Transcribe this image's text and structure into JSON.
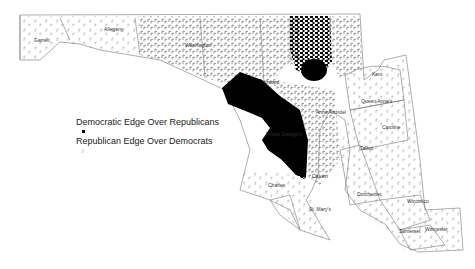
{
  "map": {
    "title": "",
    "legend": {
      "dem_label": "Democratic Edge Over Republicans",
      "rep_label": "Republican Edge Over Democrats",
      "dem_color": "#000000",
      "rep_color": "#888888"
    },
    "counties": [
      {
        "name": "Garrett",
        "x": 34,
        "y": 42
      },
      {
        "name": "Allegany",
        "x": 104,
        "y": 31
      },
      {
        "name": "Washington",
        "x": 185,
        "y": 47
      },
      {
        "name": "Howard",
        "x": 262,
        "y": 84
      },
      {
        "name": "Anne Arundel",
        "x": 316,
        "y": 114
      },
      {
        "name": "Prince George's",
        "x": 266,
        "y": 136
      },
      {
        "name": "Charles",
        "x": 268,
        "y": 187
      },
      {
        "name": "Calvert",
        "x": 312,
        "y": 178
      },
      {
        "name": "St. Mary's",
        "x": 309,
        "y": 211
      },
      {
        "name": "Kent",
        "x": 372,
        "y": 76
      },
      {
        "name": "Queen Anne's",
        "x": 361,
        "y": 103
      },
      {
        "name": "Caroline",
        "x": 382,
        "y": 129
      },
      {
        "name": "Talbot",
        "x": 360,
        "y": 150
      },
      {
        "name": "Dorchester",
        "x": 357,
        "y": 196
      },
      {
        "name": "Wicomico",
        "x": 407,
        "y": 203
      },
      {
        "name": "Somerset",
        "x": 399,
        "y": 233
      },
      {
        "name": "Worcester",
        "x": 425,
        "y": 231
      }
    ]
  }
}
